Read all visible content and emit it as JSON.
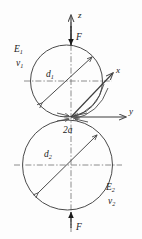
{
  "figure": {
    "type": "hertzian-contact-diagram",
    "background_color": "#fdfdfd",
    "line_color": "#4a4a4a",
    "text_color": "#1a1a1a"
  },
  "axes": {
    "z": {
      "label": "z",
      "direction": "up"
    },
    "x": {
      "label": "x",
      "direction": "up-right"
    },
    "y": {
      "label": "y",
      "direction": "right"
    }
  },
  "forces": {
    "top": {
      "label": "F",
      "direction": "down"
    },
    "bottom": {
      "label": "F",
      "direction": "up"
    }
  },
  "bodies": [
    {
      "id": "upper-sphere",
      "diameter_label": "d",
      "diameter_subscript": "1",
      "modulus_label": "E",
      "modulus_subscript": "1",
      "poisson_label": "v",
      "poisson_subscript": "1"
    },
    {
      "id": "lower-sphere",
      "diameter_label": "d",
      "diameter_subscript": "2",
      "modulus_label": "E",
      "modulus_subscript": "2",
      "poisson_label": "v",
      "poisson_subscript": "2"
    }
  ],
  "contact": {
    "width_label": "2a"
  }
}
